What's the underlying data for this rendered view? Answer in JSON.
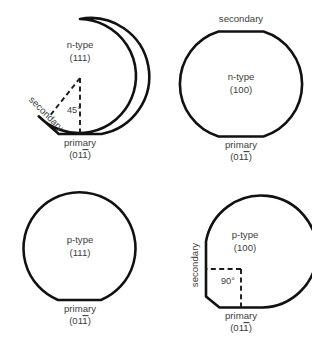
{
  "figure": {
    "background_color": "#ffffff",
    "outline_color": "#111111",
    "text_color": "#3d3d3d"
  },
  "wafers": [
    {
      "id": "n-type-111",
      "doping": "n-type",
      "orientation": "(111)",
      "primary_label": "primary",
      "primary_index_prefix": "(01",
      "primary_index_barred": "1",
      "primary_index_suffix": ")",
      "secondary_label": "secondary",
      "angle_label": "45°",
      "angle_degrees": 45,
      "has_secondary_flat": true,
      "secondary_flat_position": "lower-left",
      "shows_angle_markup": true
    },
    {
      "id": "n-type-100",
      "doping": "n-type",
      "orientation": "(100)",
      "primary_label": "primary",
      "primary_index_prefix": "(01",
      "primary_index_barred": "1",
      "primary_index_suffix": ")",
      "secondary_label": "secondary",
      "angle_label": "",
      "angle_degrees": 180,
      "has_secondary_flat": true,
      "secondary_flat_position": "top",
      "shows_angle_markup": false
    },
    {
      "id": "p-type-111",
      "doping": "p-type",
      "orientation": "(111)",
      "primary_label": "primary",
      "primary_index_prefix": "(01",
      "primary_index_barred": "1",
      "primary_index_suffix": ")",
      "secondary_label": "",
      "angle_label": "",
      "angle_degrees": 0,
      "has_secondary_flat": false,
      "secondary_flat_position": "none",
      "shows_angle_markup": false
    },
    {
      "id": "p-type-100",
      "doping": "p-type",
      "orientation": "(100)",
      "primary_label": "primary",
      "primary_index_prefix": "(01",
      "primary_index_barred": "1",
      "primary_index_suffix": ")",
      "secondary_label": "secondary",
      "angle_label": "90°",
      "angle_degrees": 90,
      "has_secondary_flat": true,
      "secondary_flat_position": "left",
      "shows_angle_markup": true
    }
  ]
}
